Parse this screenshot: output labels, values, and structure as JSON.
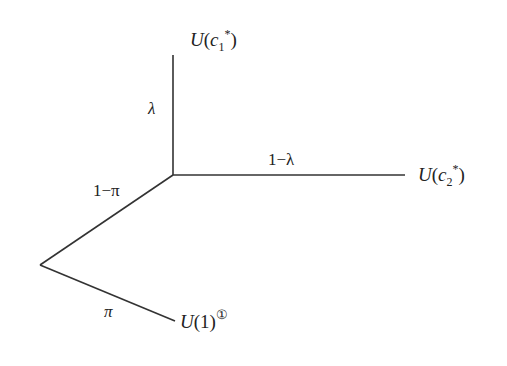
{
  "diagram": {
    "type": "decision-tree",
    "nodes": {
      "top_outcome": {
        "u": "U",
        "c": "c",
        "sub": "1",
        "sup": "*"
      },
      "right_outcome": {
        "u": "U",
        "c": "c",
        "sub": "2",
        "sup": "*"
      },
      "bottom_outcome": {
        "u": "U",
        "arg": "(1)",
        "footnote": "①"
      }
    },
    "edges": {
      "top_branch": {
        "prob": "λ"
      },
      "right_branch": {
        "prob": "1−λ"
      },
      "upper_left_branch": {
        "prob": "1−π"
      },
      "lower_left_branch": {
        "prob": "π"
      }
    },
    "line_color": "#333333",
    "text_color": "#222222"
  }
}
